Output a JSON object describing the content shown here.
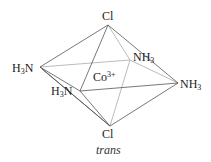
{
  "diagram": {
    "title": "trans",
    "center": {
      "label": "Co",
      "charge": "3+"
    },
    "vertices": {
      "top": {
        "label": "Cl"
      },
      "bottom": {
        "label": "Cl"
      },
      "left": {
        "prefix": "H",
        "sub": "3",
        "suffix": "N"
      },
      "front": {
        "prefix": "H",
        "sub": "3",
        "suffix": "N"
      },
      "back": {
        "prefix": "NH",
        "sub": "3"
      },
      "right": {
        "prefix": "NH",
        "sub": "3"
      }
    },
    "colors": {
      "edge_front": "#555555",
      "edge_back": "#aaaaaa"
    }
  }
}
